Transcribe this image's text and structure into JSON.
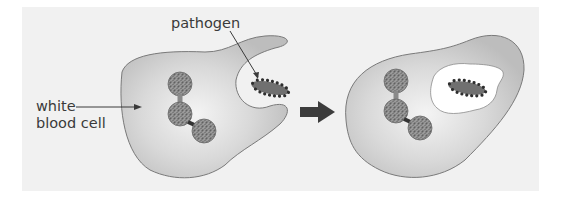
{
  "diagram": {
    "type": "process",
    "topic": "phagocytosis",
    "labels": {
      "pathogen": "pathogen",
      "white_blood_cell_line1": "white",
      "white_blood_cell_line2": "blood cell"
    },
    "stages": [
      {
        "name": "engulfing",
        "description": "white blood cell surrounds pathogen with pseudopods"
      },
      {
        "name": "engulfed",
        "description": "pathogen enclosed inside vacuole within white blood cell"
      }
    ],
    "transition": "arrow-right",
    "colors": {
      "panel": "#f1f1f1",
      "cell_fill": "#c9c9c9",
      "cell_outline": "#7a7a7a",
      "nucleus": "#8a8a8a",
      "pathogen_body": "#6e6e6e",
      "pathogen_dots": "#2f2f2f",
      "vacuole": "#ffffff",
      "arrow": "#3c3c3c",
      "text": "#3a3a3a"
    }
  }
}
